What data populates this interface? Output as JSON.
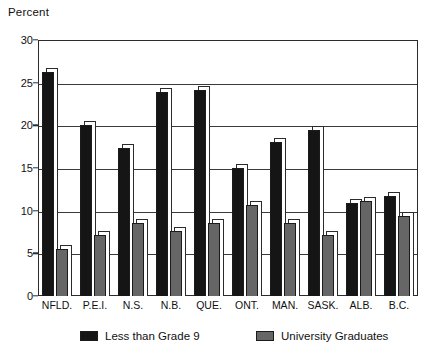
{
  "chart_data": {
    "type": "bar",
    "title": "",
    "subtitle": "",
    "xlabel": "",
    "ylabel": "Percent",
    "ylim": [
      0,
      30
    ],
    "yticks": [
      0,
      5,
      10,
      15,
      20,
      25,
      30
    ],
    "ytick_labels": [
      "0",
      "5",
      "10",
      "15",
      "20",
      "25",
      "30"
    ],
    "grid": true,
    "legend_position": "bottom",
    "categories": [
      "NFLD.",
      "P.E.I.",
      "N.S.",
      "N.B.",
      "QUE.",
      "ONT.",
      "MAN.",
      "SASK.",
      "ALB.",
      "B.C."
    ],
    "series": [
      {
        "name": "Less than Grade 9",
        "color": "#151515",
        "values": [
          26.2,
          20.0,
          17.3,
          23.9,
          24.2,
          15.0,
          18.0,
          19.4,
          10.9,
          11.7
        ]
      },
      {
        "name": "University Graduates",
        "color": "#666666",
        "values": [
          5.5,
          7.1,
          8.5,
          7.6,
          8.6,
          10.7,
          8.5,
          7.1,
          11.1,
          9.4
        ]
      }
    ],
    "annotations": []
  },
  "axis": {
    "y_title": "Percent"
  },
  "colors": {
    "series_1": "#151515",
    "series_2": "#666666",
    "axis": "#2b2b2b",
    "background": "#ffffff"
  }
}
